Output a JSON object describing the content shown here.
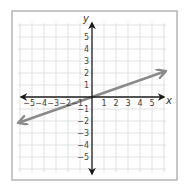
{
  "graph": {
    "axis_labels": {
      "x": "x",
      "y": "y"
    },
    "x_ticks": [
      {
        "value": -5,
        "label": "−5"
      },
      {
        "value": -4,
        "label": "−4"
      },
      {
        "value": -3,
        "label": "−3"
      },
      {
        "value": -2,
        "label": "−2"
      },
      {
        "value": -1,
        "label": "−1"
      },
      {
        "value": 1,
        "label": "1"
      },
      {
        "value": 2,
        "label": "2"
      },
      {
        "value": 3,
        "label": "3"
      },
      {
        "value": 4,
        "label": "4"
      },
      {
        "value": 5,
        "label": "5"
      }
    ],
    "y_ticks": [
      {
        "value": 5,
        "label": "5"
      },
      {
        "value": 4,
        "label": "4"
      },
      {
        "value": 3,
        "label": "3"
      },
      {
        "value": 2,
        "label": "2"
      },
      {
        "value": 1,
        "label": "1"
      },
      {
        "value": -1,
        "label": "−1"
      },
      {
        "value": -2,
        "label": "−2"
      },
      {
        "value": -3,
        "label": "−3"
      },
      {
        "value": -4,
        "label": "−4"
      },
      {
        "value": -5,
        "label": "−5"
      }
    ],
    "range": {
      "x": [
        -6,
        6
      ],
      "y": [
        -6,
        6
      ]
    },
    "line": {
      "equation": "y = (1/3)x",
      "from": [
        -6,
        -2.1
      ],
      "to": [
        6,
        2.1
      ],
      "color": "#8a8a8a"
    },
    "colors": {
      "frame": "#b5b5b5",
      "grid": "#d9d9d9",
      "axis": "#1a1a1a"
    }
  }
}
